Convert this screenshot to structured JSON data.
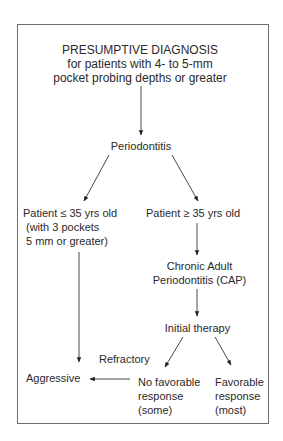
{
  "diagram": {
    "type": "flowchart",
    "nodes": {
      "root": {
        "title": "PRESUMPTIVE DIAGNOSIS",
        "line2": "for patients with 4- to 5-mm",
        "line3": "pocket probing depths or greater"
      },
      "periodontitis": {
        "label": "Periodontitis"
      },
      "young": {
        "line1": "Patient ≤ 35 yrs old",
        "line2": "(with 3 pockets",
        "line3": "5 mm or greater)"
      },
      "adult": {
        "line1": "Patient ≥  35 yrs old"
      },
      "cap": {
        "line1": "Chronic Adult",
        "line2": "Periodontitis (CAP)"
      },
      "initial_therapy": {
        "label": "Initial therapy"
      },
      "no_favorable": {
        "line1": "No favorable",
        "line2": "response",
        "line3": "(some)"
      },
      "favorable": {
        "line1": "Favorable",
        "line2": "response",
        "line3": "(most)"
      },
      "aggressive": {
        "label": "Aggressive"
      }
    },
    "edge_labels": {
      "refractory": "Refractory"
    },
    "edges": [
      {
        "from": "root",
        "to": "periodontitis"
      },
      {
        "from": "periodontitis",
        "to": "young"
      },
      {
        "from": "periodontitis",
        "to": "adult"
      },
      {
        "from": "young",
        "to": "aggressive"
      },
      {
        "from": "adult",
        "to": "cap"
      },
      {
        "from": "cap",
        "to": "initial_therapy"
      },
      {
        "from": "initial_therapy",
        "to": "no_favorable"
      },
      {
        "from": "initial_therapy",
        "to": "favorable"
      },
      {
        "from": "no_favorable",
        "to": "aggressive",
        "label": "Refractory"
      }
    ]
  }
}
